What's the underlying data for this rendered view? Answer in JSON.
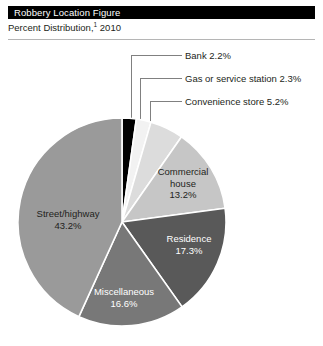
{
  "header": {
    "title": "Robbery Location Figure",
    "subtitle_prefix": "Percent Distribution,",
    "subtitle_footnote_marker": "1",
    "subtitle_year": "2010"
  },
  "chart_data": {
    "type": "pie",
    "title": "Robbery Location Figure",
    "subtitle": "Percent Distribution, 1 2010",
    "legend_position": "none",
    "labels_inside": true,
    "start_angle_deg": 0,
    "direction": "clockwise",
    "categories": [
      "Bank",
      "Gas or service station",
      "Convenience store",
      "Commercial house",
      "Residence",
      "Miscellaneous",
      "Street/highway"
    ],
    "values": [
      2.2,
      2.3,
      5.2,
      13.2,
      17.3,
      16.6,
      43.2
    ],
    "value_labels": [
      "2.2%",
      "2.3%",
      "5.2%",
      "13.2%",
      "17.3%",
      "16.6%",
      "43.2%"
    ],
    "colors": [
      "#000000",
      "#f2f2f2",
      "#dcdcdc",
      "#c6c6c6",
      "#595959",
      "#787878",
      "#9a9a9a"
    ],
    "total": 100.0,
    "slices": [
      {
        "name": "Bank",
        "value": 2.2,
        "label": "Bank 2.2%",
        "color": "#000000",
        "label_placement": "callout",
        "text_color": "#231f20"
      },
      {
        "name": "Gas or service station",
        "value": 2.3,
        "label": "Gas or service station 2.3%",
        "color": "#f2f2f2",
        "label_placement": "callout",
        "text_color": "#231f20"
      },
      {
        "name": "Convenience store",
        "value": 5.2,
        "label": "Convenience store 5.2%",
        "color": "#dcdcdc",
        "label_placement": "callout",
        "text_color": "#231f20"
      },
      {
        "name": "Commercial house",
        "value": 13.2,
        "label": "Commercial house 13.2%",
        "color": "#c6c6c6",
        "label_placement": "inside",
        "text_color": "#231f20"
      },
      {
        "name": "Residence",
        "value": 17.3,
        "label": "Residence 17.3%",
        "color": "#595959",
        "label_placement": "inside",
        "text_color": "#ffffff"
      },
      {
        "name": "Miscellaneous",
        "value": 16.6,
        "label": "Miscellaneous 16.6%",
        "color": "#787878",
        "label_placement": "inside",
        "text_color": "#ffffff"
      },
      {
        "name": "Street/highway",
        "value": 43.2,
        "label": "Street/highway 43.2%",
        "color": "#9a9a9a",
        "label_placement": "inside",
        "text_color": "#231f20"
      }
    ]
  },
  "callouts": {
    "bank": "Bank 2.2%",
    "gas": "Gas or service station 2.3%",
    "store": "Convenience store 5.2%"
  },
  "slice_labels": {
    "commercial_line1": "Commercial",
    "commercial_line2": "house",
    "commercial_line3": "13.2%",
    "residence_line1": "Residence",
    "residence_line2": "17.3%",
    "misc_line1": "Miscellaneous",
    "misc_line2": "16.6%",
    "street_line1": "Street/highway",
    "street_line2": "43.2%"
  }
}
